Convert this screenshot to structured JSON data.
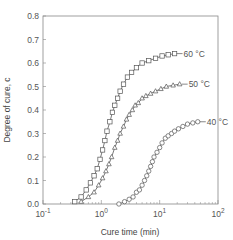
{
  "chart_data": {
    "type": "line",
    "title": "",
    "xlabel": "Cure time (min)",
    "ylabel": "Degree of cure, c",
    "xscale": "log",
    "xlim": [
      0.1,
      100
    ],
    "ylim": [
      0.0,
      0.8
    ],
    "xticks": [
      {
        "value": 0.1,
        "base": "10",
        "exp": "-1"
      },
      {
        "value": 1,
        "base": "10",
        "exp": "0"
      },
      {
        "value": 10,
        "base": "10",
        "exp": "1"
      },
      {
        "value": 100,
        "base": "10",
        "exp": "2"
      }
    ],
    "yticks": [
      "0.0",
      "0.1",
      "0.2",
      "0.3",
      "0.4",
      "0.5",
      "0.6",
      "0.7",
      "0.8"
    ],
    "grid": false,
    "legend_position": "inline labels at curve ends",
    "series": [
      {
        "name": "60 °C",
        "marker": "square",
        "x": [
          0.35,
          0.45,
          0.55,
          0.65,
          0.75,
          0.85,
          0.95,
          1.05,
          1.15,
          1.25,
          1.4,
          1.55,
          1.7,
          1.9,
          2.1,
          2.4,
          2.8,
          3.3,
          4.0,
          5.0,
          6.5,
          8.5,
          11,
          14,
          18
        ],
        "y": [
          0.01,
          0.03,
          0.06,
          0.09,
          0.12,
          0.15,
          0.19,
          0.23,
          0.27,
          0.31,
          0.35,
          0.39,
          0.42,
          0.45,
          0.48,
          0.51,
          0.54,
          0.56,
          0.58,
          0.6,
          0.61,
          0.62,
          0.63,
          0.635,
          0.64
        ]
      },
      {
        "name": "50 °C",
        "marker": "triangle",
        "x": [
          0.45,
          0.6,
          0.75,
          0.9,
          1.05,
          1.2,
          1.35,
          1.5,
          1.7,
          1.9,
          2.1,
          2.4,
          2.7,
          3.0,
          3.4,
          3.8,
          4.3,
          5.0,
          5.8,
          7.0,
          8.5,
          10.5,
          13,
          17,
          22
        ],
        "y": [
          0.01,
          0.03,
          0.05,
          0.08,
          0.11,
          0.14,
          0.17,
          0.2,
          0.24,
          0.27,
          0.3,
          0.33,
          0.36,
          0.38,
          0.4,
          0.42,
          0.43,
          0.45,
          0.46,
          0.47,
          0.48,
          0.49,
          0.5,
          0.505,
          0.51
        ]
      },
      {
        "name": "40 °C",
        "marker": "circle",
        "x": [
          2.0,
          2.5,
          3.0,
          3.5,
          4.0,
          4.5,
          5.0,
          5.5,
          6.0,
          6.5,
          7.0,
          7.5,
          8.0,
          9.0,
          10,
          11,
          12.5,
          14,
          16,
          18,
          21,
          25,
          30,
          37,
          45
        ],
        "y": [
          0.0,
          0.01,
          0.02,
          0.03,
          0.05,
          0.06,
          0.08,
          0.1,
          0.12,
          0.14,
          0.16,
          0.18,
          0.2,
          0.22,
          0.24,
          0.26,
          0.28,
          0.29,
          0.3,
          0.31,
          0.32,
          0.33,
          0.34,
          0.345,
          0.35
        ]
      }
    ],
    "annotations": [
      {
        "text": "60 °C",
        "series": "60 °C"
      },
      {
        "text": "50 °C",
        "series": "50 °C"
      },
      {
        "text": "40 °C",
        "series": "40 °C"
      }
    ]
  },
  "layout_colors": {
    "line": "#555555",
    "frame": "#888888",
    "marker_fill": "#ffffff"
  }
}
